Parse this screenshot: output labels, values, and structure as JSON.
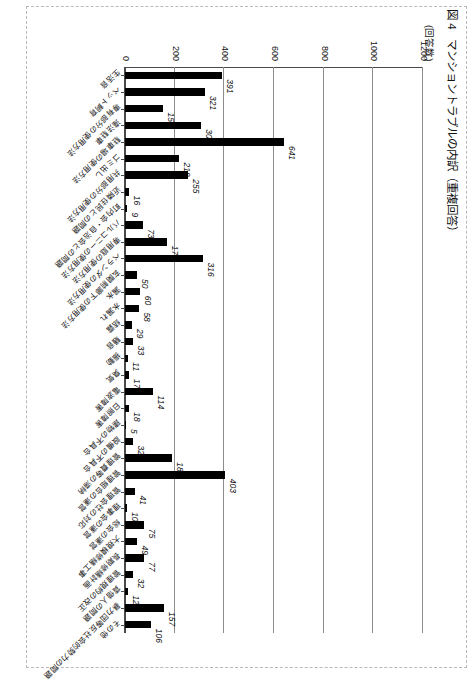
{
  "figure": {
    "label": "図 4",
    "title": "マンショントラブルの内訳（重複回答）",
    "axis_unit": "(回答数)"
  },
  "chart_data": {
    "type": "bar",
    "title": "マンショントラブルの内訳（重複回答）",
    "xlabel": "",
    "ylabel": "(回答数)",
    "ylim": [
      0,
      1200
    ],
    "yticks": [
      0,
      200,
      400,
      600,
      800,
      1000,
      1200
    ],
    "ytick_labels": [
      "0",
      "200",
      "400",
      "600",
      "800",
      "1000",
      "1200"
    ],
    "grid": true,
    "legend": "none",
    "orientation": "vertical",
    "categories": [
      "生活音",
      "ペット飼育",
      "専有部分の使用方法",
      "違法駐車",
      "駐車場の使用方法",
      "ゴミ出し",
      "共用部分の使用方法",
      "近隣住民との問題",
      "町内会・自治会との問題",
      "バルコニーの使用方法",
      "専用庭の使用方法",
      "ベランダの使用方法",
      "玄関前廊下の使用方法",
      "漏水",
      "水漏れ",
      "結露",
      "騒音",
      "振動",
      "臭気",
      "電波障害",
      "日照障害",
      "建物の不具合",
      "設備の不具合",
      "管理費等の滞納",
      "管理組合の運営",
      "管理会社の対応",
      "理事会の運営",
      "総会の運営",
      "大規模修繕工事",
      "長期修繕計画",
      "管理規約の改正",
      "賃借人の問題",
      "暴力団等反社会的勢力の問題",
      "その他"
    ],
    "values": [
      391,
      321,
      154,
      305,
      641,
      218,
      255,
      16,
      9,
      73,
      170,
      316,
      50,
      60,
      58,
      29,
      33,
      11,
      17,
      114,
      18,
      5,
      32,
      189,
      403,
      41,
      10,
      75,
      49,
      77,
      32,
      12,
      157,
      106
    ],
    "value_labels": [
      "391",
      "321",
      "154",
      "305",
      "641",
      "218",
      "255",
      "16",
      "9",
      "73",
      "170",
      "316",
      "50",
      "60",
      "58",
      "29",
      "33",
      "11",
      "17",
      "114",
      "18",
      "5",
      "32",
      "189",
      "403",
      "41",
      "10",
      "75",
      "49",
      "77",
      "32",
      "12",
      "157",
      "106"
    ],
    "bar_color": "#000000",
    "gridline_color": "#8c8c8c",
    "axis_color": "#4a4a4a"
  }
}
